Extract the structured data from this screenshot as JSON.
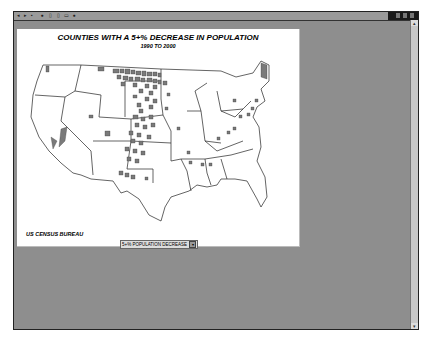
{
  "toolbar": {
    "buttons": [
      "back-icon",
      "forward-icon",
      "stop-icon",
      "refresh-icon",
      "home-icon",
      "print-icon",
      "info-icon"
    ]
  },
  "map": {
    "title": "COUNTIES WITH A 5+% DECREASE IN POPULATION",
    "subtitle": "1990 TO 2000",
    "source": "US CENSUS BUREAU",
    "legend_select": "5+% POPULATION DECREASE",
    "fill_color": "#7a7a7a",
    "outline_color": "#222222"
  }
}
